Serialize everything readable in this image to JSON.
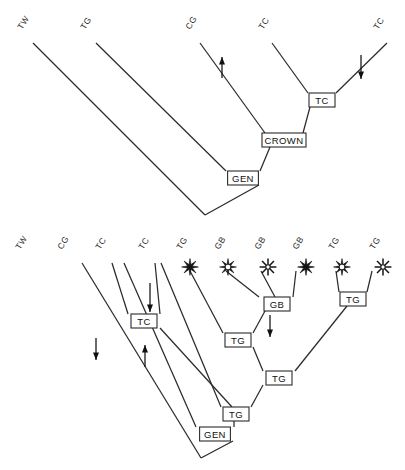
{
  "figure": {
    "background_color": "#ffffff",
    "line_color": "#2b2b2b",
    "text_color": "#111111"
  },
  "trees": [
    {
      "id": "upper-tree",
      "name": "upper-cladogram",
      "root": {
        "x": 205,
        "y": 215
      },
      "tips": [
        {
          "label": "TW",
          "x": 22,
          "y": 30,
          "marker": "none"
        },
        {
          "label": "TG",
          "x": 85,
          "y": 30,
          "marker": "none"
        },
        {
          "label": "CG",
          "x": 190,
          "y": 30,
          "marker": "none"
        },
        {
          "label": "TC",
          "x": 263,
          "y": 30,
          "marker": "none"
        },
        {
          "label": "TC",
          "x": 378,
          "y": 30,
          "marker": "none"
        }
      ],
      "nodes": [
        {
          "label": "TC",
          "x": 322,
          "y": 100
        },
        {
          "label": "CROWN",
          "x": 284,
          "y": 140
        },
        {
          "label": "GEN",
          "x": 243,
          "y": 178
        }
      ],
      "arrows": [
        {
          "direction": "up",
          "x": 222,
          "y_from": 78,
          "y_to": 57,
          "on_branch": "CG"
        },
        {
          "direction": "down",
          "x": 361,
          "y_from": 55,
          "y_to": 79,
          "on_branch": "TC-right"
        }
      ]
    },
    {
      "id": "lower-tree",
      "name": "lower-cladogram",
      "root": {
        "x": 201,
        "y": 458
      },
      "tips": [
        {
          "label": "TW",
          "x": 20,
          "y": 250,
          "marker": "none"
        },
        {
          "label": "CG",
          "x": 62,
          "y": 250,
          "marker": "none"
        },
        {
          "label": "TC",
          "x": 100,
          "y": 250,
          "marker": "none"
        },
        {
          "label": "TC",
          "x": 143,
          "y": 250,
          "marker": "none"
        },
        {
          "label": "TG",
          "x": 181,
          "y": 250,
          "marker": "star-filled"
        },
        {
          "label": "GB",
          "x": 219,
          "y": 250,
          "marker": "star-medium"
        },
        {
          "label": "GB",
          "x": 259,
          "y": 250,
          "marker": "star-open"
        },
        {
          "label": "GB",
          "x": 297,
          "y": 250,
          "marker": "star-filled"
        },
        {
          "label": "TG",
          "x": 333,
          "y": 250,
          "marker": "star-medium"
        },
        {
          "label": "TG",
          "x": 374,
          "y": 250,
          "marker": "star-open"
        }
      ],
      "nodes": [
        {
          "label": "TC",
          "x": 144,
          "y": 321
        },
        {
          "label": "GB",
          "x": 277,
          "y": 304
        },
        {
          "label": "TG",
          "x": 238,
          "y": 340
        },
        {
          "label": "TG",
          "x": 353,
          "y": 299
        },
        {
          "label": "TG",
          "x": 279,
          "y": 378
        },
        {
          "label": "TG",
          "x": 236,
          "y": 414
        },
        {
          "label": "GEN",
          "x": 215,
          "y": 434
        }
      ],
      "arrows": [
        {
          "direction": "down",
          "x": 150,
          "y_from": 283,
          "y_to": 312,
          "on_branch": "TC-into-node"
        },
        {
          "direction": "down",
          "x": 96,
          "y_from": 338,
          "y_to": 360,
          "on_branch": "CG"
        },
        {
          "direction": "up",
          "x": 145,
          "y_from": 367,
          "y_to": 345,
          "on_branch": "TC"
        },
        {
          "direction": "down",
          "x": 270,
          "y_from": 315,
          "y_to": 337,
          "on_branch": "GB-below-node"
        }
      ]
    }
  ],
  "legend_markers": {
    "star-filled": "solid-star-icon",
    "star-medium": "half-filled-star-icon",
    "star-open": "open-star-icon"
  }
}
